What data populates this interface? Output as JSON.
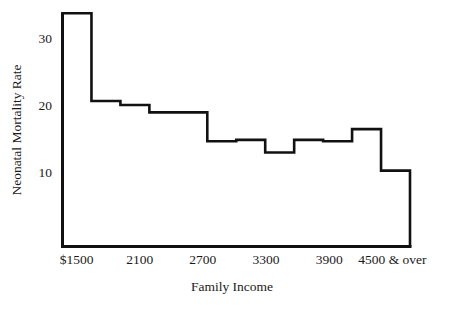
{
  "chart_data": {
    "type": "area",
    "subtype": "step-histogram",
    "title": "",
    "xlabel": "Family Income",
    "ylabel": "Neonatal Mortality Rate",
    "grid": false,
    "legend": null,
    "ylim": [
      0,
      34
    ],
    "ytick_labels": [
      "10",
      "20",
      "30"
    ],
    "ytick_values": [
      10,
      20,
      30
    ],
    "xtick_labels": [
      "$1500",
      "2100",
      "2700",
      "3300",
      "3900",
      "4500 & over"
    ],
    "xtick_values": [
      1500,
      2100,
      2700,
      3300,
      3900,
      4500
    ],
    "x_edges": [
      1500,
      1800,
      2100,
      2400,
      2700,
      3000,
      3300,
      3600,
      3900,
      4200,
      4500,
      4800
    ],
    "bin_labels": [
      "1500-1800",
      "1800-2100",
      "2100-2400",
      "2400-2700",
      "2700-3000",
      "3000-3300",
      "3300-3600",
      "3600-3900",
      "3900-4200",
      "4200-4500",
      "4500 & over"
    ],
    "values": [
      33.7,
      20.6,
      20.0,
      18.9,
      18.9,
      14.6,
      14.8,
      12.9,
      14.8,
      14.6,
      16.4,
      10.2
    ],
    "series": [
      {
        "name": "Neonatal Mortality Rate",
        "values": [
          33.7,
          20.6,
          20.0,
          18.9,
          18.9,
          14.6,
          14.8,
          12.9,
          14.8,
          14.6,
          16.4,
          10.2
        ]
      }
    ],
    "line_color": "#111111",
    "background_color": "#ffffff"
  },
  "axes": {
    "y_title": "Neonatal Mortality Rate",
    "x_title": "Family Income",
    "y_ticks": [
      {
        "label": "30",
        "value": 30
      },
      {
        "label": "20",
        "value": 20
      },
      {
        "label": "10",
        "value": 10
      }
    ],
    "x_ticks": [
      {
        "label": "$1500",
        "value": 1500
      },
      {
        "label": "2100",
        "value": 2100
      },
      {
        "label": "2700",
        "value": 2700
      },
      {
        "label": "3300",
        "value": 3300
      },
      {
        "label": "3900",
        "value": 3900
      },
      {
        "label": "4500 & over",
        "value": 4500
      }
    ]
  }
}
